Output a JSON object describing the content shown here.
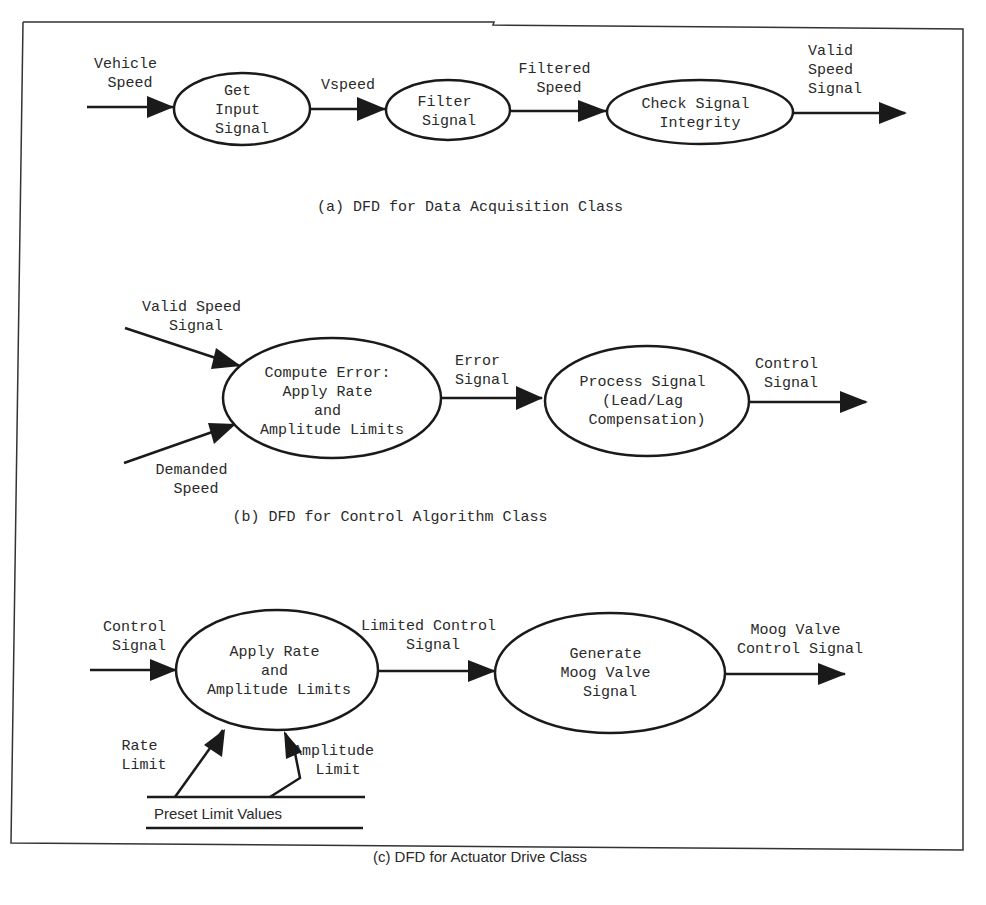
{
  "colors": {
    "stroke": "#1a1a1a",
    "text": "#2a2a2a",
    "background": "#ffffff"
  },
  "panels": [
    {
      "id": "a",
      "caption": "(a) DFD for Data Acquisition Class",
      "processes": [
        {
          "lines": [
            "Get",
            "Input",
            "Signal"
          ]
        },
        {
          "lines": [
            "Filter",
            "Signal"
          ]
        },
        {
          "lines": [
            "Check Signal",
            "Integrity"
          ]
        }
      ],
      "flows": [
        {
          "lines": [
            "Vehicle",
            "Speed"
          ]
        },
        {
          "lines": [
            "Vspeed"
          ]
        },
        {
          "lines": [
            "Filtered",
            "Speed"
          ]
        },
        {
          "lines": [
            "Valid",
            "Speed",
            "Signal"
          ]
        }
      ]
    },
    {
      "id": "b",
      "caption": "(b) DFD for Control Algorithm Class",
      "processes": [
        {
          "lines": [
            "Compute Error:",
            "Apply Rate",
            "and",
            "Amplitude Limits"
          ]
        },
        {
          "lines": [
            "Process Signal",
            "(Lead/Lag",
            "Compensation)"
          ]
        }
      ],
      "flows": [
        {
          "lines": [
            "Valid Speed",
            "Signal"
          ]
        },
        {
          "lines": [
            "Demanded",
            "Speed"
          ]
        },
        {
          "lines": [
            "Error",
            "Signal"
          ]
        },
        {
          "lines": [
            "Control",
            "Signal"
          ]
        }
      ]
    },
    {
      "id": "c",
      "caption": "(c) DFD for Actuator Drive Class",
      "processes": [
        {
          "lines": [
            "Apply Rate",
            "and",
            "Amplitude Limits"
          ]
        },
        {
          "lines": [
            "Generate",
            "Moog Valve",
            "Signal"
          ]
        }
      ],
      "flows": [
        {
          "lines": [
            "Control",
            "Signal"
          ]
        },
        {
          "lines": [
            "Limited Control",
            "Signal"
          ]
        },
        {
          "lines": [
            "Moog Valve",
            "Control Signal"
          ]
        },
        {
          "lines": [
            "Rate",
            "Limit"
          ]
        },
        {
          "lines": [
            "Amplitude",
            "Limit"
          ]
        }
      ],
      "data_store": {
        "label": "Preset Limit Values"
      }
    }
  ]
}
